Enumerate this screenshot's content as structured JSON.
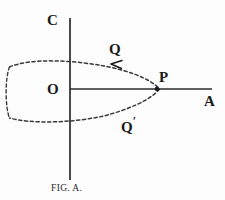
{
  "figure": {
    "caption_prefix": "F",
    "caption_rest": "IG",
    "caption_full": "FIG. A.",
    "background_color": "#fdfdfd",
    "ink_color": "#1a1a1a"
  },
  "axes": {
    "vertical_label": "C",
    "horizontal_label": "A",
    "origin_label": "O",
    "origin": {
      "x": 70,
      "y": 89
    },
    "vertical_line": {
      "x": 70,
      "y1": 18,
      "y2": 180
    },
    "horizontal_line": {
      "x1": 70,
      "x2": 212,
      "y": 89
    },
    "line_color": "#2b2b2b",
    "line_width": 1.6
  },
  "points": [
    {
      "name": "P",
      "label": "P",
      "x": 157,
      "y": 89,
      "marked": true
    },
    {
      "name": "Q",
      "label": "Q",
      "x": 116,
      "y": 60,
      "marked": false
    },
    {
      "name": "Qprime",
      "label": "Q",
      "prime": "′",
      "x": 130,
      "y": 112,
      "marked": false
    }
  ],
  "curve": {
    "style": "dashed",
    "dash_pattern": "3.2 2.6",
    "color": "#3a3a3a",
    "width": 1.5,
    "description": "flattened closed loop cusping at P",
    "right_cusp": {
      "x": 160,
      "y": 89
    },
    "left_extent": {
      "x": 9,
      "y": 89
    },
    "upper_arc_peak_y": 62,
    "lower_arc_peak_y": 122
  },
  "arrow": {
    "name": "direction-arrow",
    "tip": {
      "x": 112,
      "y": 64
    },
    "direction": "left-down along upper arc"
  }
}
